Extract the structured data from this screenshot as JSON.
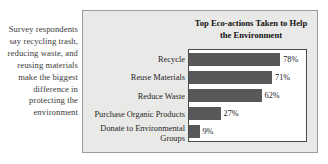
{
  "caption": {
    "text": "Survey respondents say recycling trash, reducing waste, and reusing materials make the biggest difference in protecting the environment"
  },
  "chart_data": {
    "type": "bar",
    "orientation": "horizontal",
    "title": "Top Eco-actions Taken to Help the Environment",
    "xlabel": "",
    "ylabel": "",
    "xlim": [
      0,
      100
    ],
    "grid": false,
    "legend": false,
    "categories": [
      "Recycle",
      "Reuse Materials",
      "Reduce Waste",
      "Purchase Organic Products",
      "Donate to Environmental\nGroups"
    ],
    "values": [
      78,
      71,
      62,
      27,
      9
    ],
    "value_labels": [
      "78%",
      "71%",
      "62%",
      "27%",
      "9%"
    ],
    "bar_color": "#58585a",
    "plot_background": "#ffffff",
    "panel_background": "#e9e9e7"
  }
}
